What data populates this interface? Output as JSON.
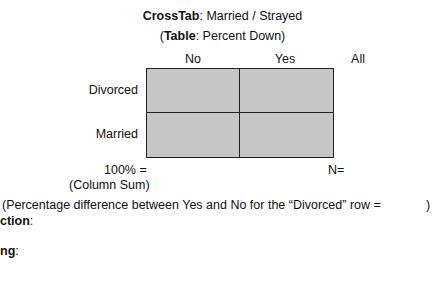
{
  "header": {
    "title_bold": "CrossTab",
    "title_rest": ": Married / Strayed",
    "subtitle_open": "(",
    "subtitle_bold": "Table",
    "subtitle_rest": ": Percent Down)"
  },
  "table": {
    "columns": [
      "No",
      "Yes",
      "All"
    ],
    "rows": [
      "Divorced",
      "Married"
    ],
    "cells": [
      [
        "",
        ""
      ],
      [
        "",
        ""
      ]
    ],
    "cell_color": "#c6c6c6",
    "border_color": "#222222"
  },
  "footer": {
    "total_label": "100% =",
    "total_sublabel": "(Column Sum)",
    "n_label": "N="
  },
  "notes": {
    "percentage_difference": "(Percentage difference between Yes and No for the “Divorced” row =",
    "percentage_difference_close": ")",
    "direction_label": "ction",
    "direction_colon": ":",
    "meaning_label": "ng",
    "meaning_colon": ":"
  }
}
